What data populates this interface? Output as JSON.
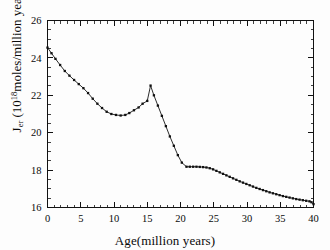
{
  "chart_data": {
    "type": "line",
    "title": "",
    "xlabel": "Age(million years)",
    "ylabel": "J_er (10^18 moles/million years)",
    "ylabel_parts": {
      "symbol": "J",
      "subscript": "er",
      "unit_open": " (10",
      "exponent": "18",
      "unit_rest": "moles/million years)"
    },
    "xlim": [
      0,
      40
    ],
    "ylim": [
      16,
      26
    ],
    "xticks": [
      0,
      5,
      10,
      15,
      20,
      25,
      30,
      35,
      40
    ],
    "yticks": [
      16,
      18,
      20,
      22,
      24,
      26
    ],
    "xtick_labels": [
      "0",
      "5",
      "10",
      "15",
      "20",
      "25",
      "30",
      "35",
      "40"
    ],
    "ytick_labels": [
      "16",
      "18",
      "20",
      "22",
      "24",
      "26"
    ],
    "x_minor_step": 1,
    "y_minor_step": 0.5,
    "grid": false,
    "legend": null,
    "ticks_all_sides": true,
    "marker": "filled-square",
    "series": [
      {
        "name": "Jer",
        "x": [
          0.0,
          0.6,
          1.2,
          1.9,
          2.6,
          3.3,
          4.0,
          4.7,
          5.4,
          6.1,
          6.8,
          7.5,
          8.2,
          8.9,
          9.6,
          10.3,
          11.0,
          11.7,
          12.3,
          13.0,
          13.7,
          14.3,
          15.0,
          15.5,
          16.0,
          16.6,
          17.2,
          17.8,
          18.4,
          19.0,
          19.6,
          20.2,
          20.9,
          21.4,
          21.9,
          22.4,
          22.9,
          23.4,
          23.9,
          24.4,
          24.9,
          25.4,
          25.9,
          26.4,
          26.9,
          27.4,
          27.9,
          28.4,
          28.9,
          29.4,
          29.9,
          30.4,
          30.9,
          31.4,
          31.9,
          32.4,
          32.9,
          33.4,
          33.9,
          34.4,
          34.9,
          35.4,
          35.9,
          36.4,
          36.9,
          37.4,
          37.9,
          38.4,
          38.9,
          39.4,
          39.7,
          40.0
        ],
        "y": [
          24.55,
          24.25,
          23.95,
          23.62,
          23.3,
          23.05,
          22.82,
          22.6,
          22.38,
          22.12,
          21.82,
          21.55,
          21.32,
          21.12,
          21.0,
          20.95,
          20.92,
          20.95,
          21.05,
          21.2,
          21.35,
          21.55,
          21.7,
          22.52,
          22.0,
          21.45,
          20.9,
          20.35,
          19.8,
          19.3,
          18.8,
          18.4,
          18.18,
          18.18,
          18.18,
          18.18,
          18.17,
          18.16,
          18.14,
          18.1,
          18.04,
          17.96,
          17.88,
          17.8,
          17.72,
          17.64,
          17.56,
          17.48,
          17.4,
          17.33,
          17.26,
          17.19,
          17.12,
          17.05,
          16.99,
          16.93,
          16.87,
          16.81,
          16.76,
          16.71,
          16.66,
          16.61,
          16.57,
          16.53,
          16.49,
          16.45,
          16.42,
          16.39,
          16.36,
          16.33,
          16.28,
          16.18
        ]
      }
    ],
    "annotations": {
      "peak": {
        "x": 15.5,
        "y": 22.52
      },
      "minimum_plateau": {
        "x": 11.0,
        "y": 20.92
      },
      "kink": {
        "x": 20.9,
        "y": 18.18
      },
      "start": {
        "x": 0.0,
        "y": 24.55
      },
      "end": {
        "x": 40.0,
        "y": 16.18
      }
    }
  }
}
